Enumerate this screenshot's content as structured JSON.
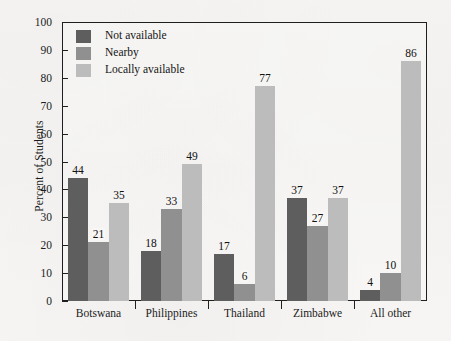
{
  "chart_data": {
    "type": "bar",
    "title": "",
    "xlabel": "",
    "ylabel": "Percent of Students",
    "ylim": [
      0,
      100
    ],
    "ytick_step": 10,
    "yticks": [
      100,
      90,
      80,
      70,
      60,
      50,
      40,
      30,
      20,
      10,
      0
    ],
    "grid": false,
    "legend_position": "top-left inside plot area",
    "categories": [
      "Botswana",
      "Philippines",
      "Thailand",
      "Zimbabwe",
      "All other"
    ],
    "series": [
      {
        "name": "Not available",
        "color": "#5e5e5e",
        "values": [
          44,
          18,
          17,
          37,
          4
        ]
      },
      {
        "name": "Nearby",
        "color": "#909090",
        "values": [
          21,
          33,
          6,
          27,
          10
        ]
      },
      {
        "name": "Locally available",
        "color": "#bcbcbc",
        "values": [
          35,
          49,
          77,
          37,
          86
        ]
      }
    ],
    "data_labels": true,
    "axis_color": "#1f1f1f",
    "background_color": "#f6f5f3"
  }
}
